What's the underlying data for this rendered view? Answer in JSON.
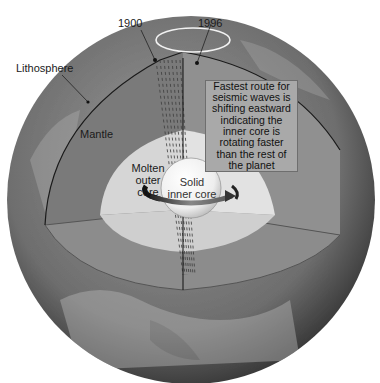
{
  "diagram": {
    "labels": {
      "year_1900": "1900",
      "year_1996": "1996",
      "lithosphere": "Lithosphere",
      "mantle": "Mantle",
      "outer_core": [
        "Molten",
        "outer",
        "core"
      ],
      "inner_core": [
        "Solid",
        "inner core"
      ]
    },
    "callout": {
      "lines": [
        "Fastest route for",
        "seismic waves is",
        "shifting eastward",
        "indicating the",
        "inner core is",
        "rotating faster",
        "than the rest of",
        "the planet"
      ]
    },
    "colors": {
      "background": "#ffffff",
      "surface": "#6f6f6f",
      "mantle": "#8a8a8a",
      "outer_core": "#d9d9d9",
      "inner_core": "#f4f4f4",
      "callout_bg": "#a9a9a9"
    }
  }
}
